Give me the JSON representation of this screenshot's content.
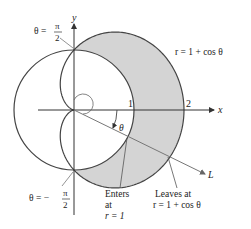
{
  "figure": {
    "axes": {
      "x_label": "x",
      "y_label": "y",
      "tick_1": "1",
      "tick_2": "2"
    },
    "curves": {
      "cardioid_label": "r = 1 + cos θ",
      "circle": "r = 1"
    },
    "angle_label": "θ",
    "line_label": "L",
    "top_angle": {
      "prefix": "θ =",
      "numerator": "π",
      "denominator": "2"
    },
    "bottom_angle": {
      "prefix": "θ = −",
      "numerator": "π",
      "denominator": "2"
    },
    "enters": {
      "line1": "Enters",
      "line2": "at",
      "line3": "r = 1"
    },
    "leaves": {
      "line1": "Leaves at",
      "line2": "r = 1 + cos θ"
    },
    "colors": {
      "shade": "#d4d4d4",
      "stroke": "#444444",
      "line": "#888888"
    }
  }
}
